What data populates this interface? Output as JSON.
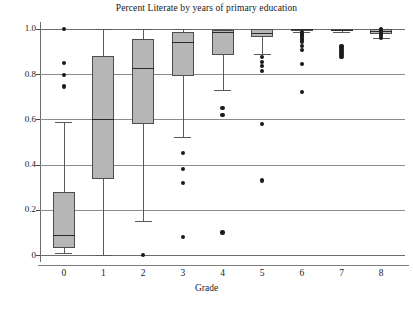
{
  "chart_data": {
    "type": "box",
    "title": "Percent Literate by years of primary education",
    "xlabel": "Grade",
    "ylabel": "",
    "xlim": [
      -0.6,
      8.6
    ],
    "ylim": [
      -0.03,
      1.03
    ],
    "grid": true,
    "legend": "none",
    "categories": [
      "0",
      "1",
      "2",
      "3",
      "4",
      "5",
      "6",
      "7",
      "8"
    ],
    "ytick_labels": [
      "1.0",
      "0.8",
      "0.6",
      "0.4",
      "0.2",
      "0"
    ],
    "ytick_values": [
      1.0,
      0.8,
      0.6,
      0.4,
      0.2,
      0.0
    ],
    "xtick_labels": [
      "0",
      "1",
      "2",
      "3",
      "4",
      "5",
      "6",
      "7",
      "8"
    ],
    "boxes": [
      {
        "category": "0",
        "whisker_low": 0.01,
        "q1": 0.03,
        "median": 0.09,
        "q3": 0.28,
        "whisker_high": 0.59,
        "outliers": [
          1.0,
          0.85,
          0.795,
          0.745
        ]
      },
      {
        "category": "1",
        "whisker_low": 0.0,
        "q1": 0.335,
        "median": 0.6,
        "q3": 0.88,
        "whisker_high": 1.0,
        "outliers": []
      },
      {
        "category": "2",
        "whisker_low": 0.15,
        "q1": 0.58,
        "median": 0.825,
        "q3": 0.955,
        "whisker_high": 1.0,
        "outliers": [
          0.0
        ]
      },
      {
        "category": "3",
        "whisker_low": 0.52,
        "q1": 0.79,
        "median": 0.94,
        "q3": 0.985,
        "whisker_high": 1.0,
        "outliers": [
          0.45,
          0.38,
          0.32,
          0.08
        ]
      },
      {
        "category": "4",
        "whisker_low": 0.73,
        "q1": 0.885,
        "median": 0.985,
        "q3": 0.995,
        "whisker_high": 1.0,
        "outliers": [
          0.65,
          0.62,
          0.1
        ]
      },
      {
        "category": "5",
        "whisker_low": 0.89,
        "q1": 0.965,
        "median": 0.982,
        "q3": 1.0,
        "whisker_high": 1.0,
        "outliers": [
          0.875,
          0.855,
          0.835,
          0.815,
          0.58,
          0.33
        ]
      },
      {
        "category": "6",
        "whisker_low": 0.985,
        "q1": 0.993,
        "median": 0.997,
        "q3": 1.0,
        "whisker_high": 1.0,
        "outliers": [
          0.985,
          0.978,
          0.97,
          0.963,
          0.956,
          0.949,
          0.942,
          0.925,
          0.905,
          0.845,
          0.72
        ]
      },
      {
        "category": "7",
        "whisker_low": 0.985,
        "q1": 0.99,
        "median": 0.995,
        "q3": 1.0,
        "whisker_high": 1.0,
        "outliers": [
          0.922,
          0.912,
          0.902,
          0.893,
          0.884,
          0.875
        ]
      },
      {
        "category": "8",
        "whisker_low": 0.96,
        "q1": 0.975,
        "median": 0.99,
        "q3": 1.0,
        "whisker_high": 1.0,
        "outliers": [
          1.0,
          0.993,
          0.985,
          0.977,
          0.969,
          0.961
        ]
      }
    ],
    "colors": {
      "box_fill": "#b6b6b6",
      "box_edge": "#4d4d4d",
      "median": "#2b2b2b",
      "whisker": "#5a5a5a",
      "outlier": "#1b1b1b",
      "grid": "#8c8c8c",
      "axis": "#6d6d6d",
      "text": "#1a1a1a",
      "background": "#ffffff"
    }
  },
  "caption": {
    "ghost_text": ""
  }
}
